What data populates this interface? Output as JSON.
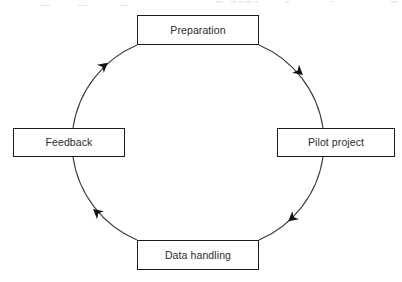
{
  "diagram": {
    "type": "cyclical-process-diagram",
    "title": "",
    "flow_direction": "clockwise",
    "geometry": {
      "center_x": 198,
      "center_y": 142,
      "radius": 107,
      "stroke_color": "#1a1a1a",
      "box_fill": "#ffffff",
      "text_color": "#2b2b2b"
    },
    "nodes": [
      {
        "id": "preparation",
        "label": "Preparation",
        "position": "top",
        "angle_deg": 270
      },
      {
        "id": "pilot-project",
        "label": "Pilot project",
        "position": "right",
        "angle_deg": 0
      },
      {
        "id": "data-handling",
        "label": "Data handling",
        "position": "bottom",
        "angle_deg": 90
      },
      {
        "id": "feedback",
        "label": "Feedback",
        "position": "left",
        "angle_deg": 180
      }
    ],
    "arrows": [
      {
        "id": "arrow-prep-to-pilot",
        "from": "preparation",
        "to": "pilot-project",
        "marker_angle_deg": 315
      },
      {
        "id": "arrow-pilot-to-data",
        "from": "pilot-project",
        "to": "data-handling",
        "marker_angle_deg": 45
      },
      {
        "id": "arrow-data-to-feedback",
        "from": "data-handling",
        "to": "feedback",
        "marker_angle_deg": 135
      },
      {
        "id": "arrow-feedback-to-prep",
        "from": "feedback",
        "to": "preparation",
        "marker_angle_deg": 225
      }
    ]
  }
}
